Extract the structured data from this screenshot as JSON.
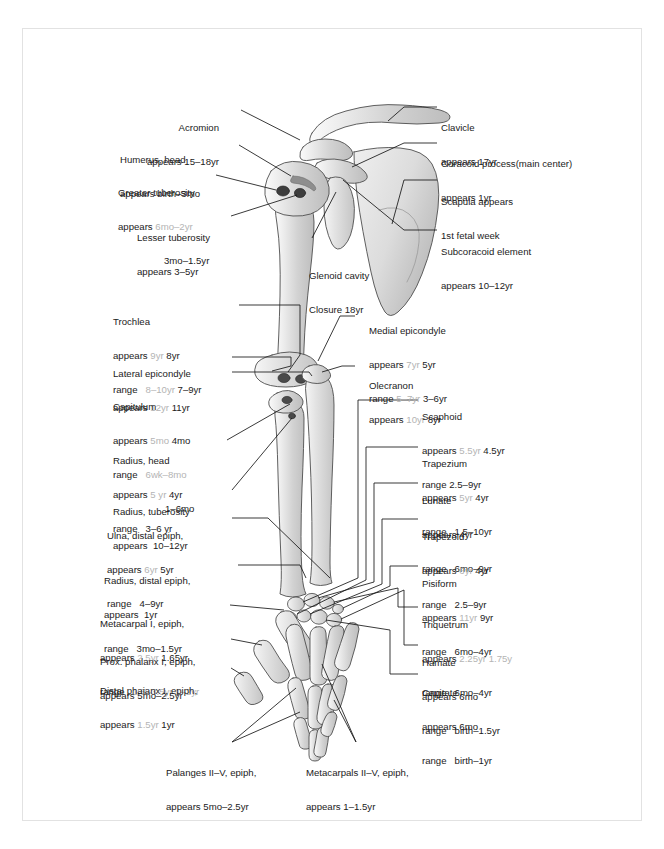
{
  "figure": {
    "legend_note": "grey values = male, black values = female",
    "colors": {
      "frame": "#e2e2e2",
      "text": "#1b1b1b",
      "male_value": "#b4b4b4",
      "bone_fill": "#dcdcdc",
      "bone_stroke": "#555555",
      "leader_line": "#111111"
    }
  },
  "labels_left": [
    {
      "name": "acromion",
      "title": "Acromion",
      "rows": [
        {
          "key": "appears",
          "male": "",
          "female": "15–18yr"
        }
      ]
    },
    {
      "name": "humerus-head",
      "title": "Humerus, head",
      "rows": [
        {
          "key": "appears",
          "male": "",
          "female": "birth–3mo"
        }
      ]
    },
    {
      "name": "greater-tuberosity",
      "title": "Greater tuberosity",
      "rows": [
        {
          "key": "appears",
          "male": "6mo–2yr",
          "female": ""
        },
        {
          "key": "",
          "male": "",
          "female": "3mo–1.5yr"
        }
      ]
    },
    {
      "name": "lesser-tuberosity",
      "title": "Lesser tuberosity",
      "rows": [
        {
          "key": "appears",
          "male": "",
          "female": "3–5yr"
        }
      ]
    },
    {
      "name": "trochlea",
      "title": "Trochlea",
      "rows": [
        {
          "key": "appears",
          "male": "9yr",
          "female": "8yr"
        },
        {
          "key": "range",
          "male": "8–10yr",
          "female": "7–9yr"
        }
      ]
    },
    {
      "name": "lateral-epicondyle",
      "title": "Lateral epicondyle",
      "rows": [
        {
          "key": "appears",
          "male": "12yr",
          "female": "11yr"
        }
      ]
    },
    {
      "name": "capitulum",
      "title": "Capitulum",
      "rows": [
        {
          "key": "appears",
          "male": "5mo",
          "female": "4mo"
        },
        {
          "key": "range",
          "male": "6wk–8mo",
          "female": ""
        },
        {
          "key": "",
          "male": "",
          "female": "1–6mo"
        }
      ]
    },
    {
      "name": "radius-head",
      "title": "Radius, head",
      "rows": [
        {
          "key": "appears",
          "male": "5 yr",
          "female": "4yr"
        },
        {
          "key": "range",
          "male": "",
          "female": "3–6 yr"
        }
      ]
    },
    {
      "name": "radius-tuberosity",
      "title": "Radius, tuberosity",
      "rows": [
        {
          "key": "appears",
          "male": "",
          "female": "10–12yr"
        }
      ]
    },
    {
      "name": "ulna-distal-epiphysis",
      "title": "Ulna, distal epiph,",
      "rows": [
        {
          "key": "appears",
          "male": "6yr",
          "female": "5yr"
        },
        {
          "key": "range",
          "male": "",
          "female": "4–9yr"
        }
      ]
    },
    {
      "name": "radius-distal-epiphysis",
      "title": "Radius, distal epiph,",
      "rows": [
        {
          "key": "appears",
          "male": "",
          "female": "1yr"
        },
        {
          "key": "range",
          "male": "",
          "female": "3mo–1.5yr"
        }
      ]
    },
    {
      "name": "metacarpal-1-epiphysis",
      "title": "Metacarpal I, epiph,",
      "rows": [
        {
          "key": "appears",
          "male": "2.5yr",
          "female": "1.65yr"
        },
        {
          "key": "range",
          "male": "1.5–3.5yr",
          "female": "1–2yr"
        }
      ]
    },
    {
      "name": "prox-phalanx-1-epiphysis",
      "title": "Prox. phalanx I, epiph,",
      "rows": [
        {
          "key": "appears",
          "male": "",
          "female": "5mo–2.5yr"
        }
      ]
    },
    {
      "name": "distal-phalanx-1-epiphysis",
      "title": "Distal phaianx I, epiph,",
      "rows": [
        {
          "key": "appears",
          "male": "1.5yr",
          "female": "1yr"
        }
      ]
    }
  ],
  "labels_right": [
    {
      "name": "clavicle",
      "title": "Clavicle",
      "rows": [
        {
          "key": "appears",
          "male": "",
          "female": "17yr"
        }
      ]
    },
    {
      "name": "coracoid-process",
      "title": "Coracoid process(main center)",
      "rows": [
        {
          "key": "appears",
          "male": "",
          "female": "1yr"
        }
      ]
    },
    {
      "name": "scapula",
      "title": "Scapula appears",
      "rows": [
        {
          "key": "",
          "male": "",
          "female": "1st fetal week"
        }
      ]
    },
    {
      "name": "subcoracoid-element",
      "title": "Subcoracoid element",
      "rows": [
        {
          "key": "appears",
          "male": "",
          "female": "10–12yr"
        }
      ]
    },
    {
      "name": "medial-epicondyle",
      "title": "Medial epicondyle",
      "rows": [
        {
          "key": "appears",
          "male": "7yr",
          "female": "5yr"
        },
        {
          "key": "range",
          "male": "5–7yr",
          "female": "3–6yr"
        }
      ]
    },
    {
      "name": "olecranon",
      "title": "Olecranon",
      "rows": [
        {
          "key": "appears",
          "male": "10yr",
          "female": "8yr"
        }
      ]
    },
    {
      "name": "scaphoid",
      "title": "Scaphoid",
      "rows": [
        {
          "key": "appears",
          "male": "5.5yr",
          "female": "4.5yr"
        },
        {
          "key": "range",
          "male": "",
          "female": "2.5–9yr"
        }
      ]
    },
    {
      "name": "trapezium",
      "title": "Trapezium",
      "rows": [
        {
          "key": "appears",
          "male": "5yr",
          "female": "4yr"
        },
        {
          "key": "range",
          "male": "",
          "female": "1.5–10yr"
        }
      ]
    },
    {
      "name": "lunate",
      "title": "Lunate",
      "rows": [
        {
          "key": "appears",
          "male": "",
          "female": "4yr"
        },
        {
          "key": "range",
          "male": "",
          "female": "6mo–9yr"
        }
      ]
    },
    {
      "name": "trapezoid",
      "title": "Trapezoid",
      "rows": [
        {
          "key": "appears",
          "male": "6yr",
          "female": "4yr"
        },
        {
          "key": "range",
          "male": "",
          "female": "2.5–9yr"
        }
      ]
    },
    {
      "name": "pisiform",
      "title": "Pisiform",
      "rows": [
        {
          "key": "appears",
          "male": "11yr",
          "female": "9yr"
        },
        {
          "key": "range",
          "male": "",
          "female": "6mo–4yr"
        }
      ]
    },
    {
      "name": "triquetrum",
      "title": "Triquetrum",
      "rows": [
        {
          "key": "appears",
          "male": "2.25yr",
          "female": "1.75y"
        },
        {
          "key": "range",
          "male": "",
          "female": "6mo–4yr"
        }
      ]
    },
    {
      "name": "hamate",
      "title": "Hamate",
      "rows": [
        {
          "key": "appears",
          "male": "",
          "female": "6mo"
        },
        {
          "key": "range",
          "male": "",
          "female": "birth–1.5yr"
        }
      ]
    },
    {
      "name": "capitate",
      "title": "Capitate",
      "rows": [
        {
          "key": "appears",
          "male": "",
          "female": "6mo"
        },
        {
          "key": "range",
          "male": "",
          "female": "birth–1yr"
        }
      ]
    }
  ],
  "labels_center": [
    {
      "name": "glenoid-cavity",
      "title": "Glenoid cavity",
      "rows": [
        {
          "key": "",
          "male": "",
          "female": "Closure 18yr"
        }
      ]
    }
  ],
  "labels_bottom": [
    {
      "name": "phalanges-2-5-epiphysis",
      "title": "Palanges II–V, epiph,",
      "rows": [
        {
          "key": "appears",
          "male": "",
          "female": "5mo–2.5yr"
        }
      ]
    },
    {
      "name": "metacarpals-2-5-epiphysis",
      "title": "Metacarpals II–V, epiph,",
      "rows": [
        {
          "key": "appears",
          "male": "",
          "female": "1–1.5yr"
        }
      ]
    }
  ]
}
